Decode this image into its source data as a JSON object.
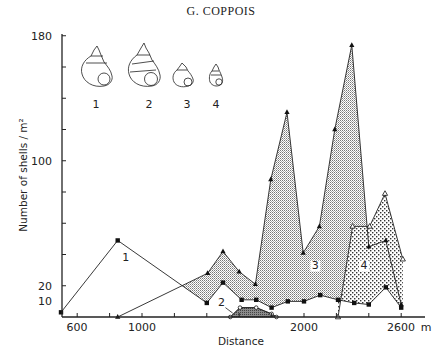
{
  "header": {
    "title": "G. COPPOIS"
  },
  "chart_data": {
    "type": "area",
    "title": "",
    "xlabel": "Distance",
    "ylabel": "Number of shells / m²",
    "x_unit": "m",
    "xlim": [
      500,
      2650
    ],
    "ylim": [
      0,
      180
    ],
    "x_ticks": [
      600,
      800,
      1000,
      1200,
      1400,
      1600,
      1800,
      2000,
      2200,
      2400,
      2600
    ],
    "x_tick_labels": [
      {
        "value": 600,
        "label": "600"
      },
      {
        "value": 1000,
        "label": "1000"
      },
      {
        "value": 2000,
        "label": "2000"
      },
      {
        "value": 2600,
        "label": "2600"
      }
    ],
    "x_unit_label": "m",
    "y_ticks": [
      20,
      40,
      60,
      80,
      100,
      120,
      140,
      160,
      180
    ],
    "y_tick_labels": [
      {
        "value": 180,
        "label": "180"
      },
      {
        "value": 100,
        "label": "100"
      },
      {
        "value": 20,
        "label": "20"
      },
      {
        "value": 10,
        "label": "10"
      }
    ],
    "grid": false,
    "series": [
      {
        "name": "1",
        "marker": "filled-square",
        "fill": "none",
        "x": [
          500,
          850,
          1400,
          1500,
          1615,
          1705,
          1800,
          1900,
          2000,
          2100,
          2210,
          2310,
          2400,
          2505,
          2600
        ],
        "values": [
          3,
          49,
          9,
          22,
          11,
          11,
          6,
          10,
          10,
          14,
          11,
          9,
          8,
          19,
          6
        ]
      },
      {
        "name": "2",
        "marker": "open-circle",
        "fill": "dark-hatch",
        "x": [
          1545,
          1605,
          1705,
          1800,
          1830
        ],
        "values": [
          0,
          6,
          6,
          2,
          0
        ]
      },
      {
        "name": "3",
        "marker": "filled-triangle",
        "fill": "fine-dots",
        "x": [
          850,
          1405,
          1500,
          1600,
          1700,
          1795,
          1895,
          1995,
          2095,
          2190,
          2295,
          2400,
          2505,
          2600
        ],
        "values": [
          0,
          28,
          42,
          29,
          21,
          88,
          131,
          41,
          58,
          120,
          174,
          45,
          49,
          8
        ]
      },
      {
        "name": "4",
        "marker": "open-triangle",
        "fill": "coarse-dots",
        "x": [
          2210,
          2300,
          2405,
          2500,
          2610
        ],
        "values": [
          0,
          58,
          58,
          79,
          37
        ]
      }
    ],
    "legend": {
      "type": "shell-drawings",
      "entries": [
        "1",
        "2",
        "3",
        "4"
      ]
    },
    "area_labels": [
      {
        "text": "1",
        "x": 900,
        "y": 36
      },
      {
        "text": "2",
        "x": 1490,
        "y": 7
      },
      {
        "text": "3",
        "x": 2070,
        "y": 31
      },
      {
        "text": "4",
        "x": 2370,
        "y": 31
      }
    ]
  }
}
